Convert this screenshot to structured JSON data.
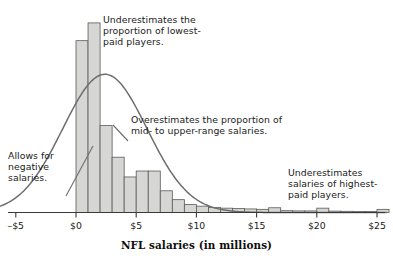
{
  "figure": {
    "width": 393,
    "height": 261,
    "background": "#ffffff"
  },
  "annotations": [
    {
      "id": "underestimates-low",
      "text": "Underestimates the proportion of lowest-paid players."
    },
    {
      "id": "overestimates-mid",
      "text": "Overestimates the proportion of mid- to upper-range salaries."
    },
    {
      "id": "negative-salaries",
      "text": "Allows for negative salaries."
    },
    {
      "id": "underestimates-high",
      "text": "Underestimates salaries of highest-paid players."
    }
  ],
  "axis": {
    "title": "NFL salaries (in millions)",
    "tick_labels": [
      "–$5",
      "$0",
      "$5",
      "$10",
      "$15",
      "$20",
      "$25"
    ],
    "tick_values": [
      -5,
      0,
      5,
      10,
      15,
      20,
      25
    ],
    "line_color": "#3a3a3a"
  },
  "colors": {
    "bar_fill": "#d6d6d4",
    "bar_stroke": "#5a5a58",
    "curve": "#6d6d6d",
    "leader_line": "#6d6d6d",
    "text": "#1a1a1a"
  },
  "chart_data": {
    "type": "bar",
    "title": "",
    "xlabel": "NFL salaries (in millions)",
    "ylabel": "",
    "xlim": [
      -6.5,
      25.8
    ],
    "ylim": [
      0,
      100
    ],
    "grid": false,
    "legend": null,
    "bin_width": 1,
    "bin_starts": [
      0,
      1,
      2,
      3,
      4,
      5,
      6,
      7,
      8,
      9,
      10,
      11,
      12,
      13,
      14,
      15,
      16,
      17,
      18,
      19,
      20,
      21,
      22,
      23,
      24,
      25
    ],
    "categories": [
      "0-1",
      "1-2",
      "2-3",
      "3-4",
      "4-5",
      "5-6",
      "6-7",
      "7-8",
      "8-9",
      "9-10",
      "10-11",
      "11-12",
      "12-13",
      "13-14",
      "14-15",
      "15-16",
      "16-17",
      "17-18",
      "18-19",
      "19-20",
      "20-21",
      "21-22",
      "22-23",
      "23-24",
      "24-25",
      "25-26"
    ],
    "values": [
      87,
      96,
      44,
      28,
      18,
      21,
      21,
      11,
      6.5,
      4,
      3.2,
      2.6,
      2.2,
      2,
      1.8,
      1.6,
      2.4,
      0.9,
      0.8,
      0.8,
      2.2,
      0.7,
      0.6,
      0.5,
      0.5,
      1.6
    ],
    "overlay_curve": {
      "type": "normal",
      "label": "normal-distribution-curve",
      "mean": 2.4,
      "sd": 3.5,
      "peak_height": 70
    }
  }
}
